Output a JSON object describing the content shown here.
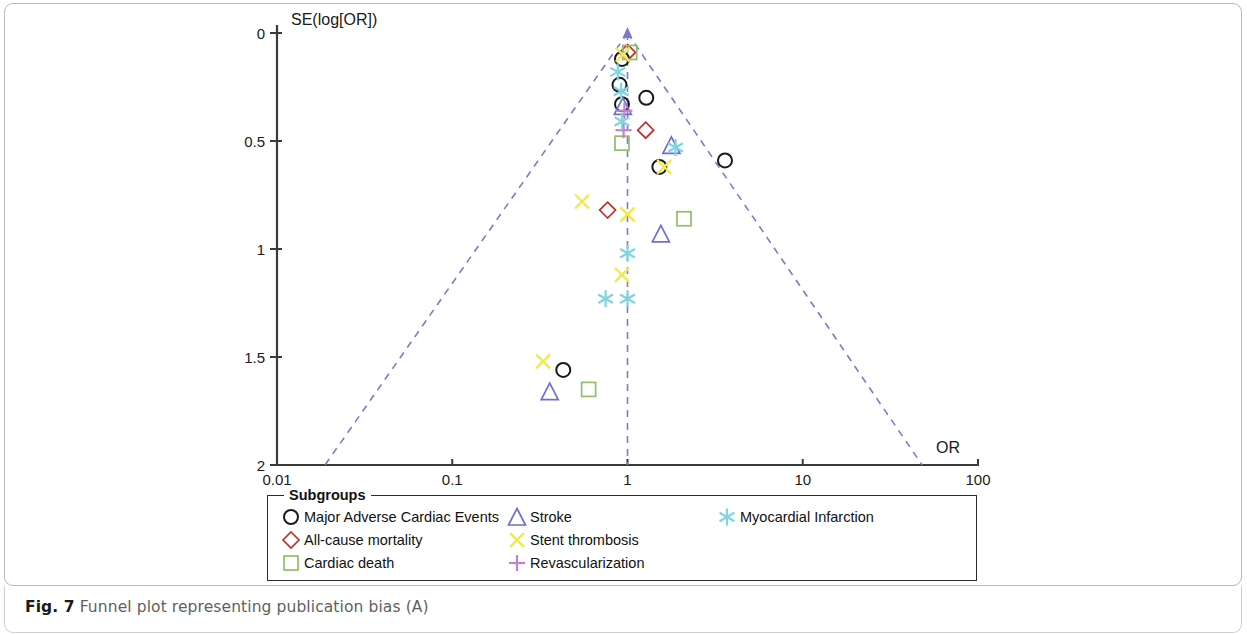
{
  "figure": {
    "caption_prefix": "Fig. 7",
    "caption_text": "Funnel plot representing publication bias (A)"
  },
  "legend": {
    "title": "Subgroups",
    "items": [
      {
        "label": "Major Adverse Cardiac Events",
        "marker": "circle",
        "color": "#1a1a1a",
        "column": 1
      },
      {
        "label": "All-cause mortality",
        "marker": "diamond",
        "color": "#b5342e",
        "column": 1
      },
      {
        "label": "Cardiac death",
        "marker": "square",
        "color": "#8fbf6a",
        "column": 1
      },
      {
        "label": "Stroke",
        "marker": "triangle",
        "color": "#6f6fd0",
        "column": 2
      },
      {
        "label": "Stent thrombosis",
        "marker": "cross-x",
        "color": "#f2e94e",
        "column": 2
      },
      {
        "label": "Revascularization",
        "marker": "plus",
        "color": "#c37fd0",
        "column": 2
      },
      {
        "label": "Myocardial Infarction",
        "marker": "asterisk",
        "color": "#7fd4de",
        "column": 3
      }
    ]
  },
  "chart_data": {
    "type": "scatter",
    "title": "",
    "subtitle": "",
    "xlabel": "OR",
    "ylabel": "SE(log[OR])",
    "xscale": "log",
    "xlim": [
      0.01,
      100
    ],
    "ylim": [
      0,
      2
    ],
    "y_inverted": true,
    "grid": false,
    "legend_position": "below-plot",
    "xticks": [
      "0.01",
      "0.1",
      "1",
      "10",
      "100"
    ],
    "xtick_values": [
      0.01,
      0.1,
      1,
      10,
      100
    ],
    "yticks": [
      "0",
      "0.5",
      "1",
      "1.5",
      "2"
    ],
    "ytick_values": [
      0,
      0.5,
      1,
      1.5,
      2
    ],
    "reference_line": {
      "or": 1.0,
      "style": "dashed",
      "color": "#7b7bc8"
    },
    "funnel_lines": {
      "style": "dashed",
      "color": "#7b7bc8",
      "apex_or": 1.0,
      "apex_se": 0,
      "left_or_at_se2": 0.0188,
      "right_or_at_se2": 48.0
    },
    "series": [
      {
        "name": "Major Adverse Cardiac Events",
        "marker": "circle",
        "color": "#1a1a1a",
        "points": [
          {
            "or": 0.93,
            "se": 0.12
          },
          {
            "or": 0.9,
            "se": 0.24
          },
          {
            "or": 1.28,
            "se": 0.3
          },
          {
            "or": 0.93,
            "se": 0.33
          },
          {
            "or": 1.52,
            "se": 0.62
          },
          {
            "or": 3.6,
            "se": 0.59
          },
          {
            "or": 0.43,
            "se": 1.56
          }
        ]
      },
      {
        "name": "All-cause mortality",
        "marker": "diamond",
        "color": "#b5342e",
        "points": [
          {
            "or": 1.0,
            "se": 0.09
          },
          {
            "or": 1.27,
            "se": 0.45
          },
          {
            "or": 0.77,
            "se": 0.82
          }
        ]
      },
      {
        "name": "Cardiac death",
        "marker": "square",
        "color": "#8fbf6a",
        "points": [
          {
            "or": 1.03,
            "se": 0.09
          },
          {
            "or": 0.93,
            "se": 0.51
          },
          {
            "or": 2.1,
            "se": 0.86
          },
          {
            "or": 0.6,
            "se": 1.65
          }
        ]
      },
      {
        "name": "Stroke",
        "marker": "triangle",
        "color": "#6f6fd0",
        "points": [
          {
            "or": 0.94,
            "se": 0.34
          },
          {
            "or": 1.78,
            "se": 0.52
          },
          {
            "or": 1.55,
            "se": 0.93
          },
          {
            "or": 0.36,
            "se": 1.66
          }
        ]
      },
      {
        "name": "Stent thrombosis",
        "marker": "cross-x",
        "color": "#f2e94e",
        "points": [
          {
            "or": 0.94,
            "se": 0.1
          },
          {
            "or": 1.62,
            "se": 0.62
          },
          {
            "or": 1.0,
            "se": 0.84
          },
          {
            "or": 0.55,
            "se": 0.78
          },
          {
            "or": 0.93,
            "se": 1.12
          },
          {
            "or": 0.33,
            "se": 1.52
          }
        ]
      },
      {
        "name": "Revascularization",
        "marker": "plus",
        "color": "#c37fd0",
        "points": [
          {
            "or": 0.96,
            "se": 0.36
          },
          {
            "or": 0.95,
            "se": 0.45
          }
        ]
      },
      {
        "name": "Myocardial Infarction",
        "marker": "asterisk",
        "color": "#7fd4de",
        "points": [
          {
            "or": 0.88,
            "se": 0.18
          },
          {
            "or": 0.92,
            "se": 0.27
          },
          {
            "or": 0.93,
            "se": 0.41
          },
          {
            "or": 1.88,
            "se": 0.53
          },
          {
            "or": 1.0,
            "se": 1.02
          },
          {
            "or": 0.75,
            "se": 1.23
          },
          {
            "or": 1.0,
            "se": 1.23
          }
        ]
      }
    ]
  }
}
